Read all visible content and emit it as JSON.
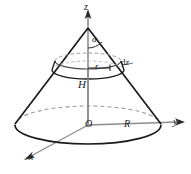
{
  "figure": {
    "background_color": "#ffffff",
    "outline_color": "#1a1a1a",
    "axis_color": "#8c8c8c",
    "hidden_edge_color": "#9a9a9a"
  },
  "axes": [
    {
      "name": "z-axis",
      "label": "z",
      "direction": "up",
      "label_position": {
        "x": 84,
        "y": 2
      }
    },
    {
      "name": "y-axis",
      "label": "y",
      "direction": "right",
      "label_position": {
        "x": 173,
        "y": 117
      }
    },
    {
      "name": "x-axis",
      "label": "x",
      "direction": "down-left",
      "label_position": {
        "x": 29,
        "y": 152
      }
    }
  ],
  "labels": {
    "origin": "O",
    "base_radius": "R",
    "height": "H",
    "shell_radius": "r",
    "apex_half_angle": "α",
    "slab_thickness_d": "d",
    "slab_thickness_z": "z"
  },
  "geometry": {
    "apex": {
      "x": 88,
      "y": 28
    },
    "origin": {
      "x": 88,
      "y": 125
    },
    "base_ellipse": {
      "cx": 88,
      "cy": 125,
      "rx": 73,
      "ry": 19
    },
    "shell_top_ellipse": {
      "cx": 88,
      "cy": 61,
      "rx": 33,
      "ry": 8
    },
    "shell_bottom_ellipse": {
      "cx": 88,
      "cy": 70,
      "rx": 36,
      "ry": 9
    },
    "z_axis_tip": {
      "x": 88,
      "y": 11
    },
    "y_axis_tip": {
      "x": 183,
      "y": 122
    },
    "x_axis_tip": {
      "x": 24,
      "y": 160
    }
  }
}
